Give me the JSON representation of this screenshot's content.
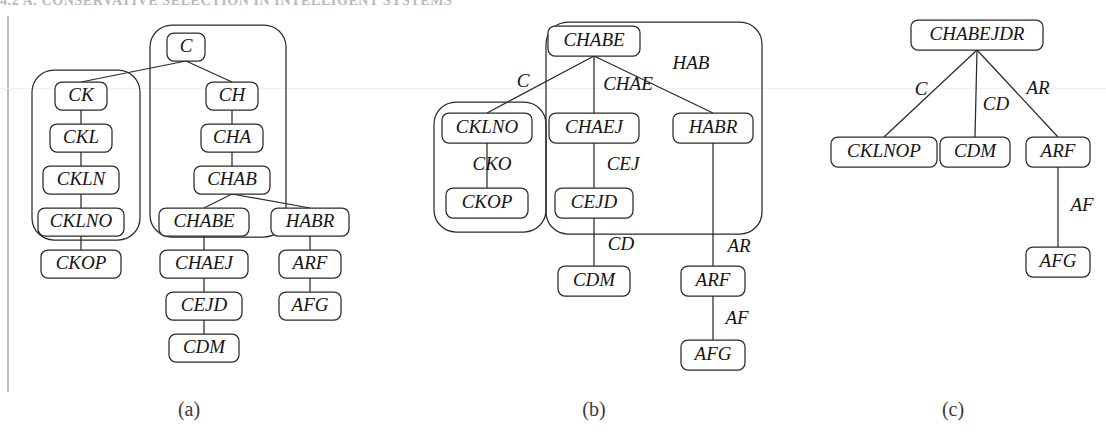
{
  "page": {
    "header_text": "4.2   A. CONSERVATIVE SELECTION IN INTELLIGENT SYSTEMS",
    "background_color": "#ffffff",
    "ink_color": "#2a2a2a"
  },
  "figure": {
    "captions": [
      {
        "id": "caption-a",
        "label": "(a)",
        "x": 189,
        "y": 411
      },
      {
        "id": "caption-b",
        "label": "(b)",
        "x": 594,
        "y": 411
      },
      {
        "id": "caption-c",
        "label": "(c)",
        "x": 953,
        "y": 411
      }
    ],
    "panels": [
      {
        "id": "panel-a",
        "caption": "(a)",
        "nodes": [
          {
            "id": "a-C",
            "label": "C",
            "x": 186,
            "y": 47,
            "w": 38,
            "h": 28
          },
          {
            "id": "a-CK",
            "label": "CK",
            "x": 81,
            "y": 96,
            "w": 52,
            "h": 28
          },
          {
            "id": "a-CH",
            "label": "CH",
            "x": 232,
            "y": 96,
            "w": 52,
            "h": 28
          },
          {
            "id": "a-CKL",
            "label": "CKL",
            "x": 81,
            "y": 138,
            "w": 62,
            "h": 28
          },
          {
            "id": "a-CHA",
            "label": "CHA",
            "x": 232,
            "y": 138,
            "w": 62,
            "h": 28
          },
          {
            "id": "a-CKLN",
            "label": "CKLN",
            "x": 81,
            "y": 180,
            "w": 76,
            "h": 28
          },
          {
            "id": "a-CHAB",
            "label": "CHAB",
            "x": 232,
            "y": 180,
            "w": 76,
            "h": 28
          },
          {
            "id": "a-CKLNO",
            "label": "CKLNO",
            "x": 81,
            "y": 222,
            "w": 86,
            "h": 28
          },
          {
            "id": "a-CHABE",
            "label": "CHABE",
            "x": 204,
            "y": 222,
            "w": 90,
            "h": 28
          },
          {
            "id": "a-HABR",
            "label": "HABR",
            "x": 310,
            "y": 222,
            "w": 78,
            "h": 28
          },
          {
            "id": "a-CKOP",
            "label": "CKOP",
            "x": 81,
            "y": 264,
            "w": 80,
            "h": 28
          },
          {
            "id": "a-CHAEJ",
            "label": "CHAEJ",
            "x": 204,
            "y": 264,
            "w": 88,
            "h": 28
          },
          {
            "id": "a-ARF",
            "label": "ARF",
            "x": 310,
            "y": 264,
            "w": 62,
            "h": 28
          },
          {
            "id": "a-CEJD",
            "label": "CEJD",
            "x": 204,
            "y": 306,
            "w": 76,
            "h": 28
          },
          {
            "id": "a-AFG",
            "label": "AFG",
            "x": 310,
            "y": 306,
            "w": 62,
            "h": 28
          },
          {
            "id": "a-CDM",
            "label": "CDM",
            "x": 204,
            "y": 348,
            "w": 70,
            "h": 28
          }
        ],
        "groups": [
          {
            "id": "a-group-ck",
            "x": 32,
            "y": 70,
            "w": 108,
            "h": 170,
            "r": 22
          },
          {
            "id": "a-group-c",
            "x": 150,
            "y": 25,
            "w": 136,
            "h": 212,
            "r": 22
          }
        ],
        "edges": [
          {
            "id": "a-e-C-CK",
            "from": "a-C",
            "to": "a-CK",
            "label": ""
          },
          {
            "id": "a-e-C-CH",
            "from": "a-C",
            "to": "a-CH",
            "label": ""
          },
          {
            "id": "a-e-CK-CKL",
            "from": "a-CK",
            "to": "a-CKL",
            "label": ""
          },
          {
            "id": "a-e-CKL-CKLN",
            "from": "a-CKL",
            "to": "a-CKLN",
            "label": ""
          },
          {
            "id": "a-e-CKLN-CKLNO",
            "from": "a-CKLN",
            "to": "a-CKLNO",
            "label": ""
          },
          {
            "id": "a-e-CKLNO-CKOP",
            "from": "a-CKLNO",
            "to": "a-CKOP",
            "label": ""
          },
          {
            "id": "a-e-CH-CHA",
            "from": "a-CH",
            "to": "a-CHA",
            "label": ""
          },
          {
            "id": "a-e-CHA-CHAB",
            "from": "a-CHA",
            "to": "a-CHAB",
            "label": ""
          },
          {
            "id": "a-e-CHAB-CHABE",
            "from": "a-CHAB",
            "to": "a-CHABE",
            "label": ""
          },
          {
            "id": "a-e-CHAB-HABR",
            "from": "a-CHAB",
            "to": "a-HABR",
            "label": ""
          },
          {
            "id": "a-e-CHABE-CHAEJ",
            "from": "a-CHABE",
            "to": "a-CHAEJ",
            "label": ""
          },
          {
            "id": "a-e-CHAEJ-CEJD",
            "from": "a-CHAEJ",
            "to": "a-CEJD",
            "label": ""
          },
          {
            "id": "a-e-CEJD-CDM",
            "from": "a-CEJD",
            "to": "a-CDM",
            "label": ""
          },
          {
            "id": "a-e-HABR-ARF",
            "from": "a-HABR",
            "to": "a-ARF",
            "label": ""
          },
          {
            "id": "a-e-ARF-AFG",
            "from": "a-ARF",
            "to": "a-AFG",
            "label": ""
          }
        ]
      },
      {
        "id": "panel-b",
        "caption": "(b)",
        "nodes": [
          {
            "id": "b-CHABE",
            "label": "CHABE",
            "x": 594,
            "y": 41,
            "w": 92,
            "h": 30
          },
          {
            "id": "b-CKLNO",
            "label": "CKLNO",
            "x": 487,
            "y": 128,
            "w": 90,
            "h": 30
          },
          {
            "id": "b-CHAEJ",
            "label": "CHAEJ",
            "x": 594,
            "y": 128,
            "w": 90,
            "h": 30
          },
          {
            "id": "b-HABR",
            "label": "HABR",
            "x": 713,
            "y": 128,
            "w": 80,
            "h": 30
          },
          {
            "id": "b-CKOP",
            "label": "CKOP",
            "x": 487,
            "y": 203,
            "w": 82,
            "h": 30
          },
          {
            "id": "b-CEJD",
            "label": "CEJD",
            "x": 594,
            "y": 203,
            "w": 78,
            "h": 30
          },
          {
            "id": "b-CDM",
            "label": "CDM",
            "x": 594,
            "y": 281,
            "w": 72,
            "h": 30
          },
          {
            "id": "b-ARF",
            "label": "ARF",
            "x": 713,
            "y": 281,
            "w": 64,
            "h": 30
          },
          {
            "id": "b-AFG",
            "label": "AFG",
            "x": 713,
            "y": 355,
            "w": 64,
            "h": 30
          }
        ],
        "groups": [
          {
            "id": "b-group-ckop",
            "x": 434,
            "y": 102,
            "w": 112,
            "h": 130,
            "r": 22
          },
          {
            "id": "b-group-chabe",
            "x": 546,
            "y": 22,
            "w": 216,
            "h": 212,
            "r": 22
          }
        ],
        "edges": [
          {
            "id": "b-e-CHABE-CKLNO",
            "from": "b-CHABE",
            "to": "b-CKLNO",
            "label": "C",
            "lx": 523,
            "ly": 83
          },
          {
            "id": "b-e-CHABE-CHAEJ",
            "from": "b-CHABE",
            "to": "b-CHAEJ",
            "label": "CHAE",
            "lx": 628,
            "ly": 86
          },
          {
            "id": "b-e-CHABE-HABR",
            "from": "b-CHABE",
            "to": "b-HABR",
            "label": "HAB",
            "lx": 691,
            "ly": 65
          },
          {
            "id": "b-e-CKLNO-CKOP",
            "from": "b-CKLNO",
            "to": "b-CKOP",
            "label": "CKO",
            "lx": 492,
            "ly": 166
          },
          {
            "id": "b-e-CHAEJ-CEJD",
            "from": "b-CHAEJ",
            "to": "b-CEJD",
            "label": "CEJ",
            "lx": 623,
            "ly": 166
          },
          {
            "id": "b-e-CEJD-CDM",
            "from": "b-CEJD",
            "to": "b-CDM",
            "label": "CD",
            "lx": 621,
            "ly": 246
          },
          {
            "id": "b-e-HABR-ARF",
            "from": "b-HABR",
            "to": "b-ARF",
            "label": "AR",
            "lx": 739,
            "ly": 248
          },
          {
            "id": "b-e-ARF-AFG",
            "from": "b-ARF",
            "to": "b-AFG",
            "label": "AF",
            "lx": 737,
            "ly": 320
          }
        ]
      },
      {
        "id": "panel-c",
        "caption": "(c)",
        "nodes": [
          {
            "id": "c-CHABEJDR",
            "label": "CHABEJDR",
            "x": 977,
            "y": 35,
            "w": 132,
            "h": 30
          },
          {
            "id": "c-CKLNOP",
            "label": "CKLNOP",
            "x": 884,
            "y": 152,
            "w": 106,
            "h": 30
          },
          {
            "id": "c-CDM",
            "label": "CDM",
            "x": 975,
            "y": 152,
            "w": 70,
            "h": 30
          },
          {
            "id": "c-ARF",
            "label": "ARF",
            "x": 1058,
            "y": 152,
            "w": 64,
            "h": 30
          },
          {
            "id": "c-AFG",
            "label": "AFG",
            "x": 1058,
            "y": 262,
            "w": 64,
            "h": 30
          }
        ],
        "groups": [],
        "edges": [
          {
            "id": "c-e-root-CKLNOP",
            "from": "c-CHABEJDR",
            "to": "c-CKLNOP",
            "label": "C",
            "lx": 921,
            "ly": 91
          },
          {
            "id": "c-e-root-CDM",
            "from": "c-CHABEJDR",
            "to": "c-CDM",
            "label": "CD",
            "lx": 996,
            "ly": 106
          },
          {
            "id": "c-e-root-ARF",
            "from": "c-CHABEJDR",
            "to": "c-ARF",
            "label": "AR",
            "lx": 1038,
            "ly": 90
          },
          {
            "id": "c-e-ARF-AFG",
            "from": "c-ARF",
            "to": "c-AFG",
            "label": "AF",
            "lx": 1082,
            "ly": 207
          }
        ]
      }
    ]
  }
}
